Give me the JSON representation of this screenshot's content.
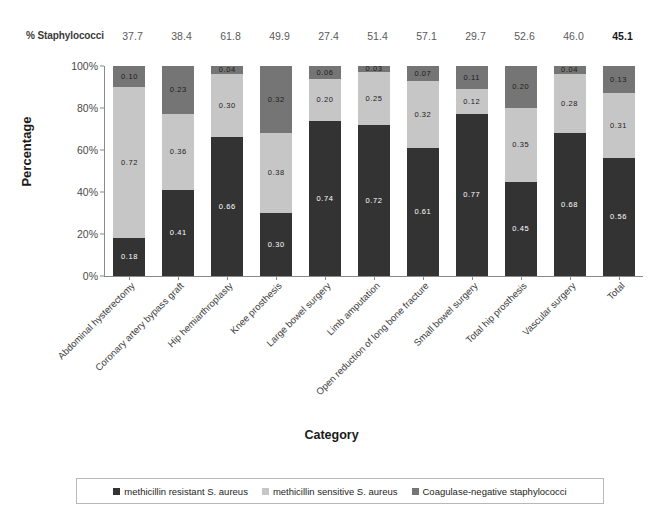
{
  "header": {
    "label": "% Staphylococci",
    "values": [
      "37.7",
      "38.4",
      "61.8",
      "49.9",
      "27.4",
      "51.4",
      "57.1",
      "29.7",
      "52.6",
      "46.0",
      "45.1"
    ],
    "bold_index": 10
  },
  "axes": {
    "ylabel": "Percentage",
    "xlabel": "Category",
    "yticks": [
      "0%",
      "20%",
      "40%",
      "60%",
      "80%",
      "100%"
    ]
  },
  "colors": {
    "mrsa": "#333333",
    "mssa": "#c6c6c6",
    "cons": "#757575",
    "axis": "#8a8a8a",
    "text": "#3d3d3d",
    "background": "#ffffff"
  },
  "legend": {
    "items": [
      {
        "label": "methicillin resistant S. aureus",
        "color": "#333333"
      },
      {
        "label": "methicillin sensitive S. aureus",
        "color": "#c6c6c6"
      },
      {
        "label": "Coagulase-negative staphylococci",
        "color": "#757575"
      }
    ]
  },
  "chart_data": {
    "type": "bar",
    "title": "",
    "subtitle": "",
    "xlabel": "Category",
    "ylabel": "Percentage",
    "ylim": [
      0,
      1
    ],
    "ytick_labels": [
      "0%",
      "20%",
      "40%",
      "60%",
      "80%",
      "100%"
    ],
    "stacked": true,
    "grid": false,
    "legend_position": "bottom",
    "categories": [
      "Abdominal hysterectomy",
      "Coronary artery bypass graft",
      "Hip hemiarthroplasty",
      "Knee prosthesis",
      "Large bowel surgery",
      "Limb amputation",
      "Open reduction of long bone fracture",
      "Small bowel surgery",
      "Total hip prosthesis",
      "Vascular surgery",
      "Total"
    ],
    "series": [
      {
        "name": "methicillin resistant S. aureus",
        "color": "#333333",
        "values": [
          0.18,
          0.41,
          0.66,
          0.3,
          0.74,
          0.72,
          0.61,
          0.77,
          0.45,
          0.68,
          0.56
        ],
        "labels": [
          "0.18",
          "0.41",
          "0.66",
          "0.30",
          "0.74",
          "0.72",
          "0.61",
          "0.77",
          "0.45",
          "0.68",
          "0.56"
        ]
      },
      {
        "name": "methicillin sensitive S. aureus",
        "color": "#c6c6c6",
        "values": [
          0.72,
          0.36,
          0.3,
          0.38,
          0.2,
          0.25,
          0.32,
          0.12,
          0.35,
          0.28,
          0.31
        ],
        "labels": [
          "0.72",
          "0.36",
          "0.30",
          "0.38",
          "0.20",
          "0.25",
          "0.32",
          "0.12",
          "0.35",
          "0.28",
          "0.31"
        ]
      },
      {
        "name": "Coagulase-negative staphylococci",
        "color": "#757575",
        "values": [
          0.1,
          0.23,
          0.04,
          0.32,
          0.06,
          0.03,
          0.07,
          0.11,
          0.2,
          0.04,
          0.13
        ],
        "labels": [
          "0.10",
          "0.23",
          "0.04",
          "0.32",
          "0.06",
          "0.03",
          "0.07",
          "0.11",
          "0.20",
          "0.04",
          "0.13"
        ]
      }
    ],
    "annotation_row": {
      "label": "% Staphylococci",
      "values": [
        37.7,
        38.4,
        61.8,
        49.9,
        27.4,
        51.4,
        57.1,
        29.7,
        52.6,
        46.0,
        45.1
      ]
    }
  }
}
